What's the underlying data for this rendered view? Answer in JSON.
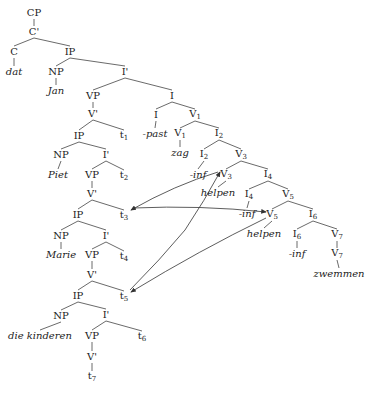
{
  "diagram": {
    "type": "syntax-tree",
    "nodes": [
      {
        "id": "cp",
        "text": "CP",
        "x": 34,
        "y": 13
      },
      {
        "id": "cbar",
        "text": "C'",
        "x": 34,
        "y": 32
      },
      {
        "id": "c",
        "text": "C",
        "x": 14,
        "y": 52
      },
      {
        "id": "ip1",
        "text": "IP",
        "x": 70,
        "y": 52
      },
      {
        "id": "dat",
        "text": "dat",
        "x": 14,
        "y": 72,
        "italic": true
      },
      {
        "id": "np1",
        "text": "NP",
        "x": 56,
        "y": 72
      },
      {
        "id": "ibar1",
        "text": "I'",
        "x": 125,
        "y": 72
      },
      {
        "id": "jan",
        "text": "Jan",
        "x": 56,
        "y": 91,
        "italic": true
      },
      {
        "id": "vp1",
        "text": "VP",
        "x": 93,
        "y": 96
      },
      {
        "id": "i_top",
        "text": "I",
        "x": 172,
        "y": 96
      },
      {
        "id": "vbar1",
        "text": "V'",
        "x": 93,
        "y": 114
      },
      {
        "id": "i_low",
        "text": "I",
        "x": 156,
        "y": 115
      },
      {
        "id": "v1a",
        "text": "V",
        "sub": "1",
        "x": 195,
        "y": 115
      },
      {
        "id": "ip2",
        "text": "IP",
        "x": 79,
        "y": 136
      },
      {
        "id": "t1",
        "text": "t",
        "sub": "1",
        "x": 124,
        "y": 136
      },
      {
        "id": "past",
        "text": "-past",
        "x": 155,
        "y": 134,
        "italic": true
      },
      {
        "id": "v1b",
        "text": "V",
        "sub": "1",
        "x": 180,
        "y": 134
      },
      {
        "id": "i2a",
        "text": "I",
        "sub": "2",
        "x": 219,
        "y": 134
      },
      {
        "id": "np2",
        "text": "NP",
        "x": 61,
        "y": 155
      },
      {
        "id": "ibar2",
        "text": "I'",
        "x": 106,
        "y": 155
      },
      {
        "id": "zag",
        "text": "zag",
        "x": 180,
        "y": 153,
        "italic": true
      },
      {
        "id": "i2b",
        "text": "I",
        "sub": "2",
        "x": 204,
        "y": 155
      },
      {
        "id": "v3a",
        "text": "V",
        "sub": "3",
        "x": 241,
        "y": 155
      },
      {
        "id": "piet",
        "text": "Piet",
        "x": 58,
        "y": 175,
        "italic": true
      },
      {
        "id": "vp2",
        "text": "VP",
        "x": 92,
        "y": 175
      },
      {
        "id": "t2",
        "text": "t",
        "sub": "2",
        "x": 124,
        "y": 176
      },
      {
        "id": "inf1",
        "text": "-inf",
        "x": 198,
        "y": 175,
        "italic": true
      },
      {
        "id": "v3b",
        "text": "V",
        "sub": "3",
        "x": 226,
        "y": 175
      },
      {
        "id": "i4a",
        "text": "I",
        "sub": "4",
        "x": 268,
        "y": 175
      },
      {
        "id": "vbar2",
        "text": "V'",
        "x": 92,
        "y": 194
      },
      {
        "id": "helpen1",
        "text": "helpen",
        "x": 218,
        "y": 193,
        "italic": true
      },
      {
        "id": "i4b",
        "text": "I",
        "sub": "4",
        "x": 249,
        "y": 195
      },
      {
        "id": "v5a",
        "text": "V",
        "sub": "5",
        "x": 288,
        "y": 195
      },
      {
        "id": "ip3",
        "text": "IP",
        "x": 78,
        "y": 215
      },
      {
        "id": "t3",
        "text": "t",
        "sub": "3",
        "x": 124,
        "y": 216
      },
      {
        "id": "inf2",
        "text": "-inf",
        "x": 247,
        "y": 214,
        "italic": true
      },
      {
        "id": "v5b",
        "text": "V",
        "sub": "5",
        "x": 272,
        "y": 215
      },
      {
        "id": "i6a",
        "text": "I",
        "sub": "6",
        "x": 313,
        "y": 215
      },
      {
        "id": "np3",
        "text": "NP",
        "x": 61,
        "y": 236
      },
      {
        "id": "ibar3",
        "text": "I'",
        "x": 106,
        "y": 236
      },
      {
        "id": "helpen2",
        "text": "helpen",
        "x": 264,
        "y": 234,
        "italic": true
      },
      {
        "id": "i6b",
        "text": "I",
        "sub": "6",
        "x": 297,
        "y": 235
      },
      {
        "id": "v7a",
        "text": "V",
        "sub": "7",
        "x": 337,
        "y": 235
      },
      {
        "id": "marie",
        "text": "Marie",
        "x": 61,
        "y": 255,
        "italic": true
      },
      {
        "id": "vp3",
        "text": "VP",
        "x": 92,
        "y": 255
      },
      {
        "id": "t4",
        "text": "t",
        "sub": "4",
        "x": 124,
        "y": 257
      },
      {
        "id": "inf3",
        "text": "-inf",
        "x": 297,
        "y": 254,
        "italic": true
      },
      {
        "id": "v7b",
        "text": "V",
        "sub": "7",
        "x": 337,
        "y": 254
      },
      {
        "id": "vbar3",
        "text": "V'",
        "x": 92,
        "y": 275
      },
      {
        "id": "zwemmen",
        "text": "zwemmen",
        "x": 339,
        "y": 274,
        "italic": true
      },
      {
        "id": "ip4",
        "text": "IP",
        "x": 78,
        "y": 296
      },
      {
        "id": "t5",
        "text": "t",
        "sub": "5",
        "x": 124,
        "y": 297
      },
      {
        "id": "np4",
        "text": "NP",
        "x": 61,
        "y": 316
      },
      {
        "id": "ibar4",
        "text": "I'",
        "x": 106,
        "y": 315
      },
      {
        "id": "kinderen",
        "text": "die kinderen",
        "x": 40,
        "y": 336,
        "italic": true
      },
      {
        "id": "vp4",
        "text": "VP",
        "x": 92,
        "y": 336
      },
      {
        "id": "t6",
        "text": "t",
        "sub": "6",
        "x": 142,
        "y": 337
      },
      {
        "id": "vbar4",
        "text": "V'",
        "x": 92,
        "y": 357
      },
      {
        "id": "t7",
        "text": "t",
        "sub": "7",
        "x": 92,
        "y": 377
      }
    ],
    "edges": [
      [
        "cp",
        "cbar"
      ],
      [
        "cbar",
        "c"
      ],
      [
        "cbar",
        "ip1"
      ],
      [
        "c",
        "dat"
      ],
      [
        "ip1",
        "np1"
      ],
      [
        "ip1",
        "ibar1"
      ],
      [
        "np1",
        "jan"
      ],
      [
        "ibar1",
        "vp1"
      ],
      [
        "ibar1",
        "i_top"
      ],
      [
        "vp1",
        "vbar1"
      ],
      [
        "vbar1",
        "ip2"
      ],
      [
        "vbar1",
        "t1"
      ],
      [
        "i_top",
        "i_low"
      ],
      [
        "i_top",
        "v1a"
      ],
      [
        "i_low",
        "past"
      ],
      [
        "v1a",
        "v1b"
      ],
      [
        "v1a",
        "i2a"
      ],
      [
        "v1b",
        "zag"
      ],
      [
        "i2a",
        "i2b"
      ],
      [
        "i2a",
        "v3a"
      ],
      [
        "i2b",
        "inf1"
      ],
      [
        "v3a",
        "v3b"
      ],
      [
        "v3a",
        "i4a"
      ],
      [
        "v3b",
        "helpen1"
      ],
      [
        "i4a",
        "i4b"
      ],
      [
        "i4a",
        "v5a"
      ],
      [
        "i4b",
        "inf2"
      ],
      [
        "v5a",
        "v5b"
      ],
      [
        "v5a",
        "i6a"
      ],
      [
        "v5b",
        "helpen2"
      ],
      [
        "i6a",
        "i6b"
      ],
      [
        "i6a",
        "v7a"
      ],
      [
        "i6b",
        "inf3"
      ],
      [
        "v7a",
        "v7b"
      ],
      [
        "v7b",
        "zwemmen"
      ],
      [
        "ip2",
        "np2"
      ],
      [
        "ip2",
        "ibar2"
      ],
      [
        "np2",
        "piet"
      ],
      [
        "ibar2",
        "vp2"
      ],
      [
        "ibar2",
        "t2"
      ],
      [
        "vp2",
        "vbar2"
      ],
      [
        "vbar2",
        "ip3"
      ],
      [
        "vbar2",
        "t3"
      ],
      [
        "ip3",
        "np3"
      ],
      [
        "ip3",
        "ibar3"
      ],
      [
        "np3",
        "marie"
      ],
      [
        "ibar3",
        "vp3"
      ],
      [
        "ibar3",
        "t4"
      ],
      [
        "vp3",
        "vbar3"
      ],
      [
        "vbar3",
        "ip4"
      ],
      [
        "vbar3",
        "t5"
      ],
      [
        "ip4",
        "np4"
      ],
      [
        "ip4",
        "ibar4"
      ],
      [
        "np4",
        "kinderen"
      ],
      [
        "ibar4",
        "vp4"
      ],
      [
        "ibar4",
        "t6"
      ],
      [
        "vp4",
        "vbar4"
      ],
      [
        "vbar4",
        "t7"
      ]
    ],
    "arrows": [
      {
        "from": "v3b",
        "to": "t3",
        "path": "M218,172 Q175,185 131,210"
      },
      {
        "from": "t3",
        "to": "v5b",
        "path": "M133,208 Q200,205 266,212"
      },
      {
        "from": "t5",
        "to": "v3b",
        "path": "M130,290 Q160,260 185,230 Q205,200 220,172"
      },
      {
        "from": "v5b",
        "to": "t5",
        "path": "M266,218 Q200,250 131,292"
      }
    ],
    "colors": {
      "line": "#444444",
      "text": "#222222",
      "arrow": "#333333"
    }
  }
}
